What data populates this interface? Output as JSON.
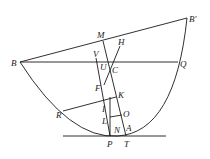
{
  "diagram": {
    "type": "parabola-geometry",
    "labels": {
      "B": "B",
      "Bp": "B′",
      "M": "M",
      "H": "H",
      "V": "V",
      "U": "U",
      "C": "C",
      "Q": "Q",
      "F": "F",
      "K": "K",
      "R": "R",
      "I": "I",
      "L": "L",
      "O": "O",
      "N": "N",
      "A": "A",
      "P": "P",
      "T": "T"
    }
  }
}
